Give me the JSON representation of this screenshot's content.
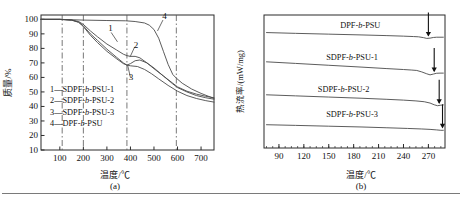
{
  "figure": {
    "bottom_rule": true,
    "colors": {
      "axis": "#2b2b2b",
      "curve": "#4a4a4a",
      "grid": "#555555",
      "text": "#111111"
    }
  },
  "panel_a": {
    "tag": "(a)",
    "xlabel": "温度/℃",
    "ylabel": "质量/%",
    "legend": [
      {
        "key": "1",
        "dash": "—",
        "label": "SDPF-b-PSU-1"
      },
      {
        "key": "2",
        "dash": "—",
        "label": "SDPF-b-PSU-2"
      },
      {
        "key": "3",
        "dash": "—",
        "label": "SDPF-b-PSU-3"
      },
      {
        "key": "4",
        "dash": "—",
        "label": "DPF-b-PSU"
      }
    ],
    "curve_tags": [
      "1",
      "2",
      "3",
      "4"
    ],
    "chart_data": {
      "type": "line",
      "title": "",
      "xlabel": "温度/℃",
      "ylabel": "质量/%",
      "xlim": [
        20,
        755
      ],
      "ylim": [
        10,
        103
      ],
      "xticks": [
        100,
        200,
        300,
        400,
        500,
        600,
        700
      ],
      "yticks": [
        10,
        20,
        30,
        40,
        50,
        60,
        70,
        80,
        90,
        100
      ],
      "grid": "vertical dash-dot at 110, 200, 385, 595",
      "vlines": [
        110,
        200,
        385,
        595
      ],
      "legend_position": "lower-left inside axes",
      "series": [
        {
          "name": "SDPF-b-PSU-1",
          "tag": "1",
          "x": [
            20,
            100,
            150,
            180,
            200,
            230,
            260,
            300,
            340,
            370,
            385,
            400,
            420,
            440,
            470,
            500,
            540,
            580,
            600,
            640,
            680,
            720,
            755
          ],
          "values": [
            100,
            100,
            99.5,
            98.5,
            96.5,
            92,
            88,
            83,
            79,
            76,
            75,
            74.5,
            74.5,
            73.5,
            70,
            66,
            61,
            56,
            53.5,
            50.5,
            48.5,
            47,
            46
          ]
        },
        {
          "name": "SDPF-b-PSU-2",
          "tag": "2",
          "x": [
            20,
            100,
            150,
            180,
            200,
            230,
            260,
            300,
            340,
            370,
            385,
            400,
            420,
            440,
            470,
            500,
            540,
            580,
            600,
            640,
            680,
            720,
            755
          ],
          "values": [
            100,
            100,
            99.5,
            98,
            95.5,
            90,
            85.5,
            79.5,
            74,
            70,
            68.5,
            69.5,
            71.5,
            72,
            70,
            66.5,
            61,
            55.5,
            53,
            50,
            47.5,
            46,
            45
          ]
        },
        {
          "name": "SDPF-b-PSU-3",
          "tag": "3",
          "x": [
            20,
            100,
            150,
            180,
            200,
            230,
            260,
            300,
            340,
            370,
            385,
            400,
            430,
            460,
            490,
            520,
            560,
            600,
            640,
            680,
            720,
            755
          ],
          "values": [
            100,
            100,
            99.5,
            98,
            95,
            89,
            84,
            78,
            73,
            69.5,
            68.5,
            68,
            67.5,
            65.5,
            62.5,
            59,
            54.5,
            50.5,
            47.5,
            45.5,
            44,
            43
          ]
        },
        {
          "name": "DPF-b-PSU",
          "tag": "4",
          "x": [
            20,
            100,
            200,
            300,
            380,
            420,
            460,
            480,
            500,
            520,
            540,
            560,
            580,
            595,
            620,
            660,
            700,
            755
          ],
          "values": [
            100,
            100,
            99.5,
            99.2,
            99,
            98.5,
            97.5,
            96,
            93,
            87,
            78,
            69,
            62,
            59.5,
            56,
            52,
            49,
            45.5
          ]
        }
      ]
    }
  },
  "panel_b": {
    "tag": "(b)",
    "xlabel": "温度/℃",
    "ylabel": "热流率/(mW/mg)",
    "curve_labels": [
      "DPF-b-PSU",
      "SDPF-b-PSU-1",
      "SDPF-b-PSU-2",
      "SDPF-b-PSU-3"
    ],
    "chart_data": {
      "type": "line",
      "title": "",
      "xlabel": "温度/℃",
      "ylabel": "热流率/(mW/mg)",
      "xlim": [
        72,
        290
      ],
      "ylim": [
        0,
        1
      ],
      "xticks": [
        90,
        120,
        150,
        180,
        210,
        240,
        270
      ],
      "minor_ticks": true,
      "yticks": [],
      "grid": "off",
      "legend_position": "inline labels above each curve",
      "annotations": [
        {
          "type": "arrow",
          "series": "DPF-b-PSU",
          "x": 270,
          "note": "glass transition marker"
        },
        {
          "type": "arrow",
          "series": "SDPF-b-PSU-1",
          "x": 277,
          "note": "glass transition marker"
        },
        {
          "type": "arrow",
          "series": "SDPF-b-PSU-2",
          "x": 283,
          "note": "glass transition marker"
        },
        {
          "type": "arrow",
          "series": "SDPF-b-PSU-3",
          "x": 287,
          "note": "glass transition marker"
        }
      ],
      "series": [
        {
          "name": "DPF-b-PSU",
          "offset": 0.845,
          "x": [
            75,
            110,
            150,
            190,
            220,
            240,
            252,
            258,
            264,
            268,
            272,
            276,
            280,
            288
          ],
          "values": [
            0.868,
            0.862,
            0.856,
            0.85,
            0.845,
            0.841,
            0.838,
            0.836,
            0.83,
            0.824,
            0.826,
            0.831,
            0.833,
            0.833
          ]
        },
        {
          "name": "SDPF-b-PSU-1",
          "offset": 0.6,
          "x": [
            75,
            110,
            150,
            190,
            220,
            240,
            250,
            256,
            262,
            268,
            272,
            276,
            280,
            284,
            288
          ],
          "values": [
            0.648,
            0.636,
            0.622,
            0.608,
            0.597,
            0.59,
            0.586,
            0.583,
            0.572,
            0.558,
            0.55,
            0.556,
            0.562,
            0.563,
            0.563
          ]
        },
        {
          "name": "SDPF-b-PSU-2",
          "offset": 0.355,
          "x": [
            75,
            110,
            150,
            190,
            220,
            240,
            255,
            265,
            272,
            277,
            281,
            285,
            288
          ],
          "values": [
            0.4,
            0.392,
            0.383,
            0.374,
            0.366,
            0.36,
            0.354,
            0.348,
            0.338,
            0.325,
            0.318,
            0.322,
            0.324
          ]
        },
        {
          "name": "SDPF-b-PSU-3",
          "offset": 0.15,
          "x": [
            75,
            110,
            150,
            190,
            220,
            245,
            262,
            272,
            280,
            285,
            288
          ],
          "values": [
            0.175,
            0.17,
            0.164,
            0.158,
            0.152,
            0.147,
            0.143,
            0.14,
            0.136,
            0.133,
            0.133
          ]
        }
      ]
    }
  }
}
